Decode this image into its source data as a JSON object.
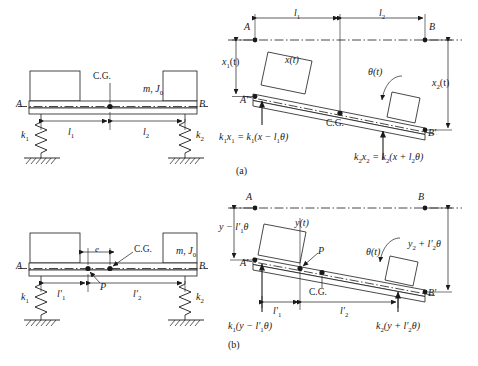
{
  "figure": {
    "panels": [
      {
        "caption": "(a)",
        "description": "Bar supported on springs k1 and k2 with C.G. reference coordinates x(t) and theta(t)"
      },
      {
        "caption": "(b)",
        "description": "Bar supported on springs k1 and k2 with point P reference coordinates y(t) and theta(t), eccentricity e"
      }
    ]
  },
  "panel_a_left": {
    "point_A": "A",
    "point_B": "B",
    "cg": "C.G.",
    "mass_inertia": "m, J",
    "mass_inertia_sub": "0",
    "spring1": "k",
    "spring1_sub": "1",
    "spring2": "k",
    "spring2_sub": "2",
    "dim_l1": "l",
    "dim_l1_sub": "1",
    "dim_l2": "l",
    "dim_l2_sub": "2"
  },
  "panel_a_right": {
    "point_A": "A",
    "point_B": "B",
    "point_Ap": "A′",
    "point_Bp": "B′",
    "cg": "C.G.",
    "dim_l1": "l",
    "dim_l1_sub": "1",
    "dim_l2": "l",
    "dim_l2_sub": "2",
    "disp_x1": "x",
    "disp_x1_sub": "1",
    "disp_x1_t": "(t)",
    "disp_x": "x(t)",
    "disp_x2": "x",
    "disp_x2_sub": "2",
    "disp_x2_t": "(t)",
    "theta": "θ(t)",
    "force_left_parts": [
      "k",
      "1",
      "x",
      "1",
      " = k",
      "1",
      "(x − l",
      "1",
      "θ)"
    ],
    "force_right_parts": [
      "k",
      "2",
      "x",
      "2",
      " = k",
      "2",
      "(x + l",
      "2",
      "θ)"
    ],
    "caption": "(a)"
  },
  "panel_b_left": {
    "point_A": "A",
    "point_B": "B",
    "cg": "C.G.",
    "point_P": "P",
    "ecc": "e",
    "mass_inertia": "m, J",
    "mass_inertia_sub": "0",
    "spring1": "k",
    "spring1_sub": "1",
    "spring2": "k",
    "spring2_sub": "2",
    "dim_l1": "l′",
    "dim_l1_sub": "1",
    "dim_l2": "l′",
    "dim_l2_sub": "2"
  },
  "panel_b_right": {
    "point_A": "A",
    "point_B": "B",
    "point_Ap": "A′",
    "point_Bp": "B′",
    "cg": "C.G.",
    "point_P": "P",
    "disp_y": "y(t)",
    "theta": "θ(t)",
    "disp_left": [
      "y − l′",
      "1",
      "θ"
    ],
    "disp_right": [
      "y",
      "2",
      " + l′",
      "2",
      "θ"
    ],
    "dim_l1": "l′",
    "dim_l1_sub": "1",
    "dim_l2": "l′",
    "dim_l2_sub": "2",
    "force_left_parts": [
      "k",
      "1",
      "(y − l′",
      "1",
      "θ)"
    ],
    "force_right_parts": [
      "k",
      "2",
      "(y + l′",
      "2",
      "θ)"
    ],
    "caption": "(b)"
  },
  "style": {
    "line_color": "#1a1a1a",
    "bg": "#ffffff"
  }
}
